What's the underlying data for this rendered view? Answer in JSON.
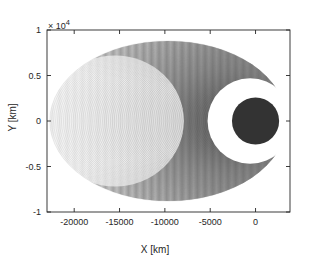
{
  "chart_data": {
    "type": "line",
    "title": "",
    "xlabel": "X [km]",
    "ylabel": "Y [km]",
    "y_exponent_label": "× 10",
    "y_exponent_power": "4",
    "xlim": [
      -23000,
      3800
    ],
    "ylim": [
      -10000,
      10000
    ],
    "xticks": [
      -20000,
      -15000,
      -10000,
      -5000,
      0
    ],
    "xticklabels": [
      "-20000",
      "-15000",
      "-10000",
      "-5000",
      "0"
    ],
    "yticks": [
      10000,
      5000,
      0,
      -5000,
      -10000
    ],
    "yticklabels": [
      "1",
      "0.5",
      "0",
      "-0.5",
      "-1"
    ],
    "grid": false,
    "legend": null,
    "series": [
      {
        "name": "orbit-family",
        "focus_x": 0,
        "focus_y": 0,
        "n_orbits": 90,
        "apoapsis_x_min": -3500,
        "apoapsis_x_max": -22700,
        "semi_minor_min": 1500,
        "semi_minor_max": 8800,
        "color": "#808080"
      }
    ],
    "central_body": {
      "name": "central-body",
      "center_x": 0,
      "center_y": 0,
      "radius_km": 2600,
      "color": "#333333"
    },
    "clear_zone": {
      "name": "periapsis-clearance-zone",
      "center_x": -600,
      "center_y": 0,
      "radius_km": 4600,
      "color": "#ffffff"
    },
    "envelope": {
      "name": "orbit-envelope-shading",
      "color_light": "#d9d9d9",
      "color_dark": "#4d4d4d"
    }
  },
  "axes": {
    "box_color": "#262626",
    "tick_color": "#262626",
    "background": "#ffffff"
  }
}
